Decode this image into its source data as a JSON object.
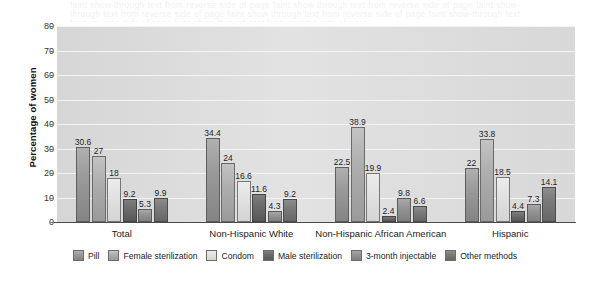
{
  "bleed_text": "faint show-through text from reverse side of page",
  "chart_data": {
    "type": "bar",
    "title": "",
    "xlabel": "",
    "ylabel": "Percentage of women",
    "ylim": [
      0,
      80
    ],
    "ytick_step": 10,
    "yticks": [
      "0",
      "10",
      "20",
      "30",
      "40",
      "50",
      "60",
      "70",
      "80"
    ],
    "grid": true,
    "legend_position": "bottom",
    "categories": [
      "Total",
      "Non-Hispanic White",
      "Non-Hispanic African American",
      "Hispanic"
    ],
    "series": [
      {
        "name": "Pill",
        "values": [
          30.6,
          34.4,
          22.5,
          22.0
        ],
        "labels": [
          "30.6",
          "34.4",
          "22.5",
          "22"
        ]
      },
      {
        "name": "Female sterilization",
        "values": [
          27.0,
          24.0,
          38.9,
          33.8
        ],
        "labels": [
          "27",
          "24",
          "38.9",
          "33.8"
        ]
      },
      {
        "name": "Condom",
        "values": [
          18.0,
          16.6,
          19.9,
          18.5
        ],
        "labels": [
          "18",
          "16.6",
          "19.9",
          "18.5"
        ]
      },
      {
        "name": "Male sterilization",
        "values": [
          9.2,
          11.6,
          2.4,
          4.4
        ],
        "labels": [
          "9.2",
          "11.6",
          "2.4",
          "4.4"
        ]
      },
      {
        "name": "3-month injectable",
        "values": [
          5.3,
          4.3,
          9.8,
          7.3
        ],
        "labels": [
          "5.3",
          "4.3",
          "9.8",
          "7.3"
        ]
      },
      {
        "name": "Other methods",
        "values": [
          9.9,
          9.2,
          6.6,
          14.1
        ],
        "labels": [
          "9.9",
          "9.2",
          "6.6",
          "14.1"
        ]
      }
    ],
    "colors": {
      "pill": "#9a9a9a",
      "female_sterilization": "#aeaeae",
      "condom": "#e2e2e2",
      "male_sterilization": "#6c6c6c",
      "injectable": "#949494",
      "other_methods": "#7a7a7a",
      "plot_background": "#dcdcdc",
      "gridline": "#f4f4f4",
      "axis": "#4a4a4a"
    }
  }
}
